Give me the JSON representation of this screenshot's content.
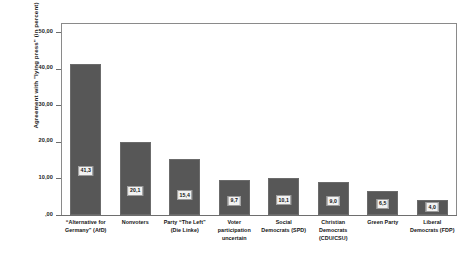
{
  "chart_data": {
    "type": "bar",
    "title": "",
    "xlabel": "",
    "ylabel": "Agreement with \"lying press\" (in percent)",
    "ylim": [
      0,
      52.5
    ],
    "grid": false,
    "legend": null,
    "bar_color": "#575757",
    "categories": [
      "“Alternative for Germany” (AfD)",
      "Nonvoters",
      "Party “The Left” (Die Linke)",
      "Voter participation uncertain",
      "Social Democrats (SPD)",
      "Christian Democrats (CDU/CSU)",
      "Green Party",
      "Liberal Democrats (FDP)"
    ],
    "category_lines": [
      [
        "“Alternative for",
        "Germany” (AfD)"
      ],
      [
        "Nonvoters"
      ],
      [
        "Party “The Left”",
        "(Die Linke)"
      ],
      [
        "Voter",
        "participation",
        "uncertain"
      ],
      [
        "Social",
        "Democrats (SPD)"
      ],
      [
        "Christian",
        "Democrats",
        "(CDU/CSU)"
      ],
      [
        "Green Party"
      ],
      [
        "Liberal",
        "Democrats (FDP)"
      ]
    ],
    "values": [
      41.3,
      20.1,
      15.4,
      9.7,
      10.1,
      9.0,
      6.5,
      4.0
    ],
    "value_labels": [
      "41,3",
      "20,1",
      "15,4",
      "9,7",
      "10,1",
      "9,0",
      "6,5",
      "4,0"
    ],
    "y_ticks": [
      0,
      10,
      20,
      30,
      40,
      50
    ],
    "y_tick_labels": [
      ",00",
      "10,00",
      "20,00",
      "30,00",
      "40,00",
      "50,00"
    ]
  }
}
